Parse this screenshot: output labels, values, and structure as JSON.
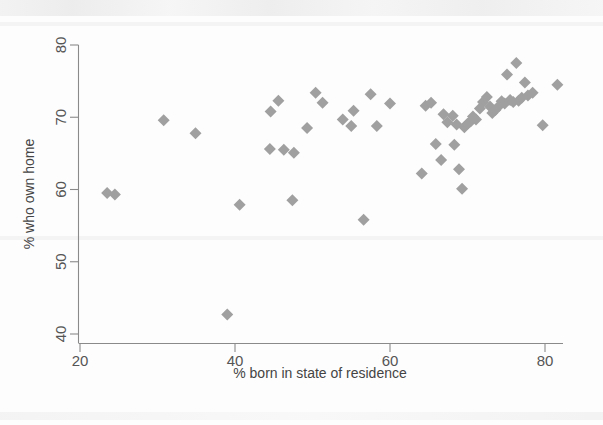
{
  "chart_data": {
    "type": "scatter",
    "title": "",
    "xlabel": "% born in state of residence",
    "ylabel": "% who own home",
    "xlim": [
      20,
      83
    ],
    "ylim": [
      40,
      81
    ],
    "xticks": [
      20,
      40,
      60,
      80
    ],
    "yticks": [
      40,
      50,
      60,
      70,
      80
    ],
    "grid": false,
    "legend": null,
    "marker": {
      "shape": "diamond",
      "color": "#a0a0a0",
      "size": 11
    },
    "points": [
      {
        "x": 23.5,
        "y": 59.5
      },
      {
        "x": 24.5,
        "y": 59.3
      },
      {
        "x": 30.8,
        "y": 69.6
      },
      {
        "x": 34.9,
        "y": 67.8
      },
      {
        "x": 39.0,
        "y": 42.7
      },
      {
        "x": 40.6,
        "y": 57.9
      },
      {
        "x": 44.5,
        "y": 65.6
      },
      {
        "x": 44.6,
        "y": 70.8
      },
      {
        "x": 45.6,
        "y": 72.3
      },
      {
        "x": 46.3,
        "y": 65.5
      },
      {
        "x": 47.4,
        "y": 58.5
      },
      {
        "x": 47.6,
        "y": 65.1
      },
      {
        "x": 49.3,
        "y": 68.5
      },
      {
        "x": 50.4,
        "y": 73.4
      },
      {
        "x": 51.3,
        "y": 72.0
      },
      {
        "x": 53.9,
        "y": 69.7
      },
      {
        "x": 55.0,
        "y": 68.8
      },
      {
        "x": 55.3,
        "y": 70.9
      },
      {
        "x": 56.6,
        "y": 55.8
      },
      {
        "x": 57.5,
        "y": 73.2
      },
      {
        "x": 58.3,
        "y": 68.8
      },
      {
        "x": 64.1,
        "y": 62.2
      },
      {
        "x": 64.6,
        "y": 71.6
      },
      {
        "x": 65.9,
        "y": 66.3
      },
      {
        "x": 66.6,
        "y": 64.1
      },
      {
        "x": 66.9,
        "y": 70.4
      },
      {
        "x": 67.4,
        "y": 69.3
      },
      {
        "x": 68.1,
        "y": 70.2
      },
      {
        "x": 68.6,
        "y": 69.0
      },
      {
        "x": 68.9,
        "y": 62.8
      },
      {
        "x": 69.3,
        "y": 60.1
      },
      {
        "x": 69.6,
        "y": 68.6
      },
      {
        "x": 70.0,
        "y": 69.1
      },
      {
        "x": 70.4,
        "y": 69.4
      },
      {
        "x": 70.7,
        "y": 70.1
      },
      {
        "x": 71.1,
        "y": 69.7
      },
      {
        "x": 71.6,
        "y": 71.2
      },
      {
        "x": 72.0,
        "y": 72.1
      },
      {
        "x": 72.5,
        "y": 72.8
      },
      {
        "x": 72.9,
        "y": 71.5
      },
      {
        "x": 73.2,
        "y": 70.6
      },
      {
        "x": 73.6,
        "y": 71.0
      },
      {
        "x": 74.1,
        "y": 71.6
      },
      {
        "x": 74.4,
        "y": 72.2
      },
      {
        "x": 74.8,
        "y": 71.9
      },
      {
        "x": 75.1,
        "y": 75.9
      },
      {
        "x": 75.5,
        "y": 72.4
      },
      {
        "x": 75.9,
        "y": 72.1
      },
      {
        "x": 76.3,
        "y": 77.5
      },
      {
        "x": 76.6,
        "y": 72.3
      },
      {
        "x": 77.0,
        "y": 72.7
      },
      {
        "x": 77.4,
        "y": 74.8
      },
      {
        "x": 77.8,
        "y": 73.0
      },
      {
        "x": 78.4,
        "y": 73.4
      },
      {
        "x": 79.7,
        "y": 68.9
      },
      {
        "x": 81.6,
        "y": 74.5
      },
      {
        "x": 65.3,
        "y": 72.0
      },
      {
        "x": 68.3,
        "y": 66.2
      },
      {
        "x": 60.0,
        "y": 71.9
      }
    ]
  },
  "axes": {
    "x_title": "% born in state of residence",
    "y_title": "% who own home",
    "x_tick_labels": [
      "20",
      "40",
      "60",
      "80"
    ],
    "y_tick_labels": [
      "40",
      "50",
      "60",
      "70",
      "80"
    ]
  }
}
